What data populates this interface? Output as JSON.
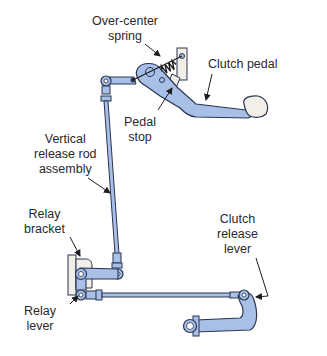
{
  "diagram": {
    "colors": {
      "part_fill": "#a8bfe8",
      "part_stroke": "#2b3550",
      "bracket_fill": "#f2efe8",
      "background": "#ffffff",
      "text": "#2a2a2a"
    },
    "labels": {
      "over_center_spring": [
        "Over-center",
        "spring"
      ],
      "clutch_pedal": [
        "Clutch pedal"
      ],
      "pedal_stop": [
        "Pedal",
        "stop"
      ],
      "vertical_release_rod": [
        "Vertical",
        "release rod",
        "assembly"
      ],
      "relay_bracket": [
        "Relay",
        "bracket"
      ],
      "clutch_release_lever": [
        "Clutch",
        "release",
        "lever"
      ],
      "relay_lever": [
        "Relay",
        "lever"
      ]
    }
  }
}
